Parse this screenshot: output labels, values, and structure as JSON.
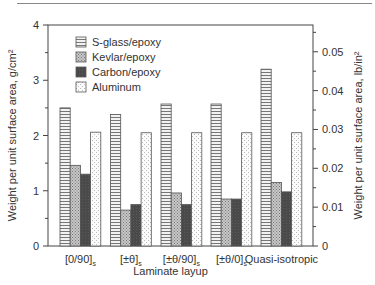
{
  "chart_data": {
    "type": "bar",
    "title": "",
    "xlabel": "Laminate layup",
    "ylabel": "Weight per unit surface area, g/cm²",
    "ylabel_right": "Weight per unit surface area, lb/in²",
    "ylim": [
      0,
      4
    ],
    "ylim_right": [
      0,
      0.057
    ],
    "yticks": [
      "0",
      "1",
      "2",
      "3",
      "4"
    ],
    "yticks_right": [
      "0",
      "0.01",
      "0.02",
      "0.03",
      "0.04",
      "0.05"
    ],
    "categories": [
      "[0/90]s",
      "[±θ]s",
      "[±θ/90]s",
      "[±θ/0]s",
      "Quasi-isotropic"
    ],
    "category_labels": [
      {
        "main": "[0/90]",
        "sub": "s"
      },
      {
        "main": "[±θ]",
        "sub": "s"
      },
      {
        "main": "[±θ/90]",
        "sub": "s"
      },
      {
        "main": "[±θ/0]",
        "sub": "s"
      },
      {
        "main": "Quasi-isotropic",
        "sub": ""
      }
    ],
    "series": [
      {
        "name": "S-glass/epoxy",
        "pattern": "horizontal-lines",
        "values": [
          2.5,
          2.38,
          2.57,
          2.57,
          3.2
        ]
      },
      {
        "name": "Kevlar/epoxy",
        "pattern": "crosshatch-gray",
        "values": [
          1.46,
          0.65,
          0.96,
          0.85,
          1.15
        ]
      },
      {
        "name": "Carbon/epoxy",
        "pattern": "dark-gray",
        "values": [
          1.3,
          0.75,
          0.75,
          0.85,
          0.98
        ]
      },
      {
        "name": "Aluminum",
        "pattern": "light-dots",
        "values": [
          2.06,
          2.05,
          2.05,
          2.05,
          2.05
        ]
      }
    ],
    "legend_position": "upper-left-inside",
    "grid": false
  }
}
